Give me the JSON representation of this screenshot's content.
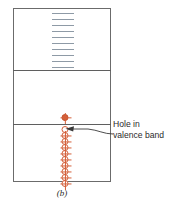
{
  "figure": {
    "caption": "(b)",
    "colors": {
      "frame": "#6b6b6b",
      "level_dash": "#8e9aa6",
      "carrier": "#d4603a",
      "text": "#2b2b2b",
      "background": "#ffffff"
    }
  },
  "bands": [
    {
      "id": "conduction-band",
      "name": "conduction band region",
      "top": 8,
      "height": 62
    },
    {
      "id": "band-gap",
      "name": "band gap region",
      "top": 70,
      "height": 54
    },
    {
      "id": "valence-band",
      "name": "valence band region",
      "top": 124,
      "height": 58
    }
  ],
  "energy_levels": {
    "name": "discrete energy levels",
    "count": 10,
    "y_positions": [
      13,
      19,
      25,
      31,
      37,
      43,
      49,
      55,
      61,
      67
    ]
  },
  "carriers": {
    "name": "valence band carrier column",
    "items": [
      {
        "y": 2,
        "type": "ion"
      },
      {
        "y": 14,
        "type": "hole"
      },
      {
        "y": 20,
        "type": "electron"
      },
      {
        "y": 26,
        "type": "electron"
      },
      {
        "y": 32,
        "type": "electron"
      },
      {
        "y": 38,
        "type": "electron"
      },
      {
        "y": 44,
        "type": "electron"
      },
      {
        "y": 50,
        "type": "electron"
      },
      {
        "y": 56,
        "type": "electron"
      },
      {
        "y": 62,
        "type": "electron"
      },
      {
        "y": 68,
        "type": "electron"
      }
    ]
  },
  "callout": {
    "line1": "Hole in",
    "line2": "valence band"
  }
}
